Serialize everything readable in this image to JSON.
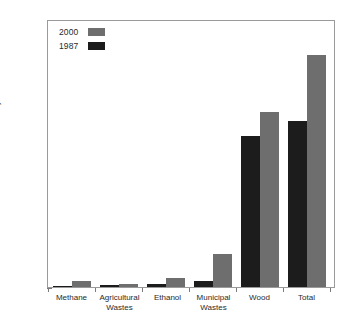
{
  "chart_data": {
    "type": "bar",
    "title": "",
    "subtitle": "",
    "xlabel": "",
    "ylabel": "Exajoules/Year",
    "ylim": [
      0,
      5
    ],
    "y_ticks": [
      0,
      1,
      2,
      3,
      4,
      5
    ],
    "y_tick_labels": [
      "0",
      "1",
      "2",
      "3",
      "4",
      "5"
    ],
    "y_minor_tick_step": 0.25,
    "grid": false,
    "legend_position": "top-left",
    "categories": [
      "Methane",
      "Agricultural\nWastes",
      "Ethanol",
      "Municipal\nWastes",
      "Wood",
      "Total"
    ],
    "series": [
      {
        "name": "1987",
        "color": "#1c1c1c",
        "values": [
          0.02,
          0.04,
          0.06,
          0.12,
          2.82,
          3.1
        ]
      },
      {
        "name": "2000",
        "color": "#6e6e6e",
        "values": [
          0.11,
          0.05,
          0.16,
          0.62,
          3.27,
          4.33
        ]
      }
    ],
    "annotations": []
  },
  "legend": {
    "entries": [
      {
        "label": "2000",
        "swatch": "gray-swatch"
      },
      {
        "label": "1987",
        "swatch": "black-swatch"
      }
    ]
  },
  "axis": {
    "y_title": "Exajoules/Year",
    "tick_0": "0",
    "tick_1": "1",
    "tick_2": "2",
    "tick_3": "3",
    "tick_4": "4",
    "tick_5": "5"
  },
  "x_labels": {
    "methane": "Methane",
    "agricultural_wastes": "Agricultural\nWastes",
    "ethanol": "Ethanol",
    "municipal_wastes": "Municipal\nWastes",
    "wood": "Wood",
    "total": "Total"
  },
  "colors": {
    "series_2000": "#6e6e6e",
    "series_1987": "#1c1c1c",
    "axis": "#9a9a9a",
    "text": "#2a2a2a",
    "background": "#ffffff"
  }
}
